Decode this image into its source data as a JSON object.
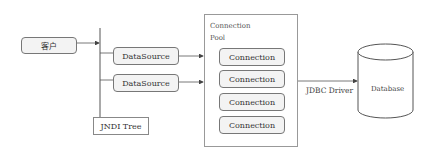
{
  "client": {
    "label": "客户"
  },
  "datasources": [
    {
      "label": "DataSource"
    },
    {
      "label": "DataSource"
    }
  ],
  "jndi": {
    "label": "JNDI Tree"
  },
  "pool": {
    "title_line1": "Connection",
    "title_line2": "Pool",
    "connections": [
      {
        "label": "Connection"
      },
      {
        "label": "Connection"
      },
      {
        "label": "Connection"
      },
      {
        "label": "Connection"
      }
    ]
  },
  "driver": {
    "label": "JDBC Driver"
  },
  "database": {
    "label": "Database"
  }
}
